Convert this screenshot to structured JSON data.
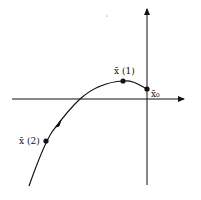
{
  "diagram": {
    "type": "phase-trajectory",
    "axes": {
      "horizontal_arrow": true,
      "vertical_arrow": true
    },
    "points": [
      {
        "id": "x1",
        "label": "x̄ (1)",
        "x": 123,
        "y": 81
      },
      {
        "id": "x0",
        "label": "x̄₀",
        "x": 147,
        "y": 89
      },
      {
        "id": "x2",
        "label": "x̄ (2)",
        "x": 46,
        "y": 141
      }
    ],
    "colors": {
      "ink": "#111111",
      "background": "#ffffff"
    }
  }
}
